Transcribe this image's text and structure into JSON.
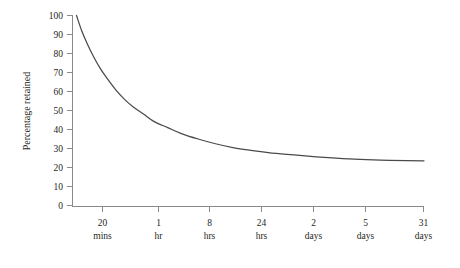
{
  "chart_data": {
    "type": "line",
    "title": "",
    "xlabel": "",
    "ylabel": "Percentage retained",
    "ylim": [
      0,
      100
    ],
    "ytick_step": 10,
    "grid": false,
    "legend": "none",
    "line_color": "#4a4a4a",
    "axis_color": "#8a8a8a",
    "background": "#ffffff",
    "yticks": [
      "0",
      "10",
      "20",
      "30",
      "40",
      "50",
      "60",
      "70",
      "80",
      "90",
      "100"
    ],
    "xticks": [
      {
        "value": "20",
        "unit": "mins"
      },
      {
        "value": "1",
        "unit": "hr"
      },
      {
        "value": "8",
        "unit": "hrs"
      },
      {
        "value": "24",
        "unit": "hrs"
      },
      {
        "value": "2",
        "unit": "days"
      },
      {
        "value": "5",
        "unit": "days"
      },
      {
        "value": "31",
        "unit": "days"
      }
    ],
    "categories": [
      "20 mins",
      "1 hr",
      "8 hrs",
      "24 hrs",
      "2 days",
      "5 days",
      "31 days"
    ],
    "series": [
      {
        "name": "Percentage retained",
        "values": [
          76,
          56,
          42,
          32,
          28,
          25,
          23.5
        ]
      }
    ],
    "curve_points": [
      {
        "x": 0,
        "y": 100
      },
      {
        "x": 0.12,
        "y": 92
      },
      {
        "x": 0.25,
        "y": 85
      },
      {
        "x": 0.4,
        "y": 78
      },
      {
        "x": 0.55,
        "y": 72
      },
      {
        "x": 0.7,
        "y": 67
      },
      {
        "x": 0.9,
        "y": 61
      },
      {
        "x": 1.1,
        "y": 56
      },
      {
        "x": 1.3,
        "y": 52
      },
      {
        "x": 1.55,
        "y": 48
      },
      {
        "x": 1.8,
        "y": 44
      },
      {
        "x": 2.1,
        "y": 41
      },
      {
        "x": 2.4,
        "y": 38
      },
      {
        "x": 2.8,
        "y": 35
      },
      {
        "x": 3.2,
        "y": 32.5
      },
      {
        "x": 3.6,
        "y": 30.5
      },
      {
        "x": 4.1,
        "y": 28.8
      },
      {
        "x": 4.6,
        "y": 27.4
      },
      {
        "x": 5.2,
        "y": 26.2
      },
      {
        "x": 5.8,
        "y": 25.2
      },
      {
        "x": 6.4,
        "y": 24.4
      },
      {
        "x": 7,
        "y": 23.9
      },
      {
        "x": 7.6,
        "y": 23.6
      },
      {
        "x": 8,
        "y": 23.5
      }
    ]
  },
  "axes": {
    "y_title": "Percentage retained",
    "y_labels": {
      "t100": "100",
      "t90": "90",
      "t80": "80",
      "t70": "70",
      "t60": "60",
      "t50": "50",
      "t40": "40",
      "t30": "30",
      "t20": "20",
      "t10": "10",
      "t0": "0"
    },
    "x_labels": {
      "k0_value": "20",
      "k0_unit": "mins",
      "k1_value": "1",
      "k1_unit": "hr",
      "k2_value": "8",
      "k2_unit": "hrs",
      "k3_value": "24",
      "k3_unit": "hrs",
      "k4_value": "2",
      "k4_unit": "days",
      "k5_value": "5",
      "k5_unit": "days",
      "k6_value": "31",
      "k6_unit": "days"
    }
  }
}
